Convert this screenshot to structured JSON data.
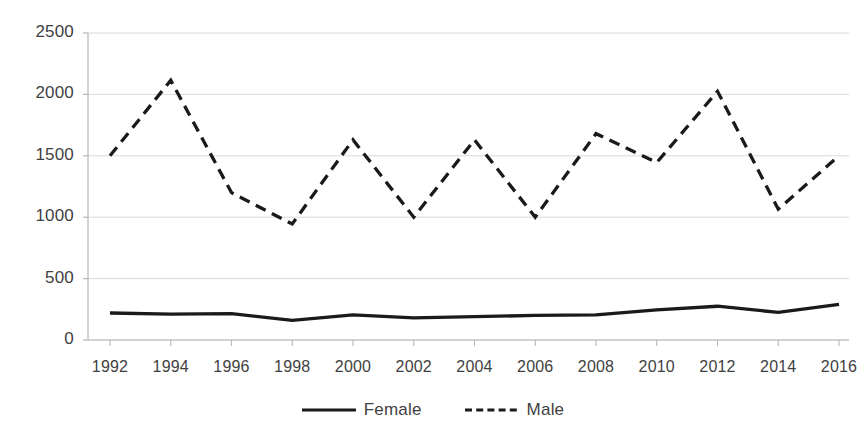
{
  "chart_data": {
    "type": "line",
    "title": "",
    "xlabel": "",
    "ylabel": "",
    "categories": [
      1992,
      1994,
      1996,
      1998,
      2000,
      2002,
      2004,
      2006,
      2008,
      2010,
      2012,
      2014,
      2016
    ],
    "xtick_labels": [
      "1992",
      "1994",
      "1996",
      "1998",
      "2000",
      "2002",
      "2004",
      "2006",
      "2008",
      "2010",
      "2012",
      "2014",
      "2016"
    ],
    "ytick_labels": [
      "0",
      "500",
      "1000",
      "1500",
      "2000",
      "2500"
    ],
    "yticks": [
      0,
      500,
      1000,
      1500,
      2000,
      2500
    ],
    "ylim": [
      0,
      2500
    ],
    "grid": true,
    "grid_axis": "y",
    "legend_position": "bottom",
    "series": [
      {
        "name": "Female",
        "style": "solid",
        "color": "#1a1a1a",
        "values": [
          220,
          210,
          215,
          160,
          205,
          180,
          190,
          200,
          205,
          245,
          275,
          225,
          290
        ]
      },
      {
        "name": "Male",
        "style": "dashed",
        "color": "#1a1a1a",
        "values": [
          1500,
          2115,
          1200,
          945,
          1630,
          1000,
          1630,
          1000,
          1680,
          1445,
          2025,
          1065,
          1500
        ]
      }
    ]
  },
  "legend": {
    "entries": [
      {
        "label": "Female",
        "style": "solid"
      },
      {
        "label": "Male",
        "style": "dashed"
      }
    ]
  },
  "colors": {
    "line": "#1a1a1a",
    "axis": "#b7b7b7",
    "grid": "#d9d9d9",
    "text": "#3f3f3f",
    "background": "#ffffff"
  }
}
